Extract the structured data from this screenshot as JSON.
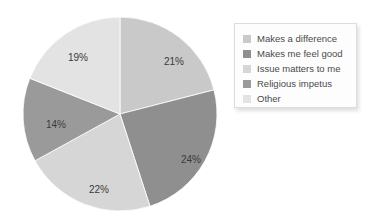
{
  "chart_data": {
    "type": "pie",
    "title": "",
    "subtitle": "",
    "xlabel": "",
    "ylabel": "",
    "legend_position": "right",
    "grid": false,
    "categories": [
      "Makes a difference",
      "Makes me feel good",
      "Issue matters to me",
      "Religious impetus",
      "Other"
    ],
    "values": [
      21,
      24,
      22,
      14,
      19
    ],
    "data_labels": [
      "21%",
      "24%",
      "22%",
      "14%",
      "19%"
    ],
    "colors": [
      "#c9c9c9",
      "#8f8f8f",
      "#d6d6d6",
      "#9a9a9a",
      "#e3e3e3"
    ],
    "units": "percent",
    "total": 100,
    "start_angle_deg": 0,
    "direction": "clockwise",
    "slices": [
      {
        "label": "Makes a difference",
        "value": 21,
        "display": "21%",
        "color": "#c9c9c9",
        "label_x": 152,
        "label_y": 48
      },
      {
        "label": "Makes me feel good",
        "value": 24,
        "display": "24%",
        "color": "#8f8f8f",
        "label_x": 169,
        "label_y": 146
      },
      {
        "label": "Issue matters to me",
        "value": 22,
        "display": "22%",
        "color": "#d6d6d6",
        "label_x": 77,
        "label_y": 176
      },
      {
        "label": "Religious impetus",
        "value": 14,
        "display": "14%",
        "color": "#9a9a9a",
        "label_x": 34,
        "label_y": 111
      },
      {
        "label": "Other",
        "value": 19,
        "display": "19%",
        "color": "#e3e3e3",
        "label_x": 56,
        "label_y": 44
      }
    ]
  },
  "legend": {
    "items": [
      {
        "label": "Makes a difference",
        "color": "#c9c9c9"
      },
      {
        "label": "Makes me feel good",
        "color": "#8f8f8f"
      },
      {
        "label": "Issue matters to me",
        "color": "#d6d6d6"
      },
      {
        "label": "Religious impetus",
        "color": "#9a9a9a"
      },
      {
        "label": "Other",
        "color": "#e3e3e3"
      }
    ]
  }
}
